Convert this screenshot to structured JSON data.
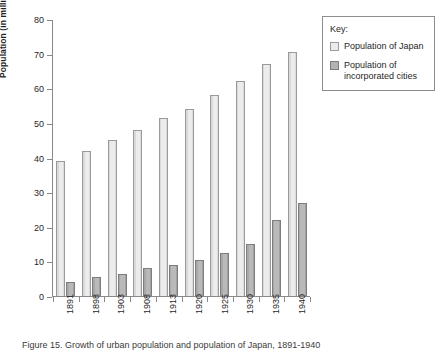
{
  "figure": {
    "caption": "Figure 15. Growth of urban population and population of Japan, 1891-1940"
  },
  "legend": {
    "title": "Key:",
    "items": [
      {
        "label": "Population of Japan",
        "swatch": "light-gray-swatch",
        "color": "#ececec"
      },
      {
        "label": "Population of incorporated cities",
        "swatch": "dark-gray-swatch",
        "color": "#b3b3b3"
      }
    ]
  },
  "axes": {
    "ylabel": "Population (in millions)",
    "yticks": [
      "0",
      "10",
      "20",
      "30",
      "40",
      "50",
      "60",
      "70",
      "80"
    ],
    "xticks": [
      "1891",
      "1898",
      "1903",
      "1908",
      "1913",
      "1920",
      "1925",
      "1930",
      "1935",
      "1940"
    ]
  },
  "chart_data": {
    "type": "bar",
    "title": "",
    "xlabel": "",
    "ylabel": "Population (in millions)",
    "ylim": [
      0,
      80
    ],
    "ytick_step": 10,
    "grid": false,
    "legend_position": "right-outside",
    "categories": [
      "1891",
      "1898",
      "1903",
      "1908",
      "1913",
      "1920",
      "1925",
      "1930",
      "1935",
      "1940"
    ],
    "series": [
      {
        "name": "Population of Japan",
        "color": "#ececec",
        "values": [
          39,
          42,
          45,
          48,
          51.5,
          54,
          58,
          62,
          67,
          70.5
        ]
      },
      {
        "name": "Population of incorporated cities",
        "color": "#b3b3b3",
        "values": [
          4,
          5.5,
          6.5,
          8,
          9,
          10.5,
          12.5,
          15,
          22,
          27
        ]
      }
    ]
  }
}
